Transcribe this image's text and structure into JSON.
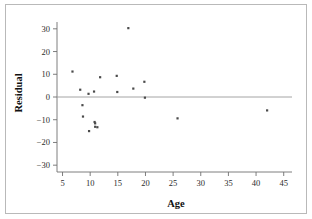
{
  "chart_data": {
    "type": "scatter",
    "title": "",
    "xlabel": "Age",
    "ylabel": "Residual",
    "xlim": [
      4,
      46.5
    ],
    "ylim": [
      -33,
      33
    ],
    "xticks": [
      5,
      10,
      15,
      20,
      25,
      30,
      35,
      40,
      45
    ],
    "yticks": [
      30,
      20,
      10,
      0,
      -10,
      -20,
      -30
    ],
    "xtick_labels": [
      "5",
      "10",
      "15",
      "20",
      "25",
      "30",
      "35",
      "40",
      "45"
    ],
    "ytick_labels": [
      "30",
      "20",
      "10",
      "0",
      "−10",
      "−20",
      "−30"
    ],
    "grid": false,
    "legend": false,
    "reference_line": {
      "orientation": "horizontal",
      "y": 0
    },
    "marker": {
      "shape": "square",
      "size": 2.2,
      "color": "#4a4a4a"
    },
    "points": [
      {
        "x": 6.8,
        "y": 11.2
      },
      {
        "x": 8.2,
        "y": 3.2
      },
      {
        "x": 8.6,
        "y": -3.6
      },
      {
        "x": 8.7,
        "y": -8.6
      },
      {
        "x": 9.7,
        "y": 1.4
      },
      {
        "x": 9.8,
        "y": -15.0
      },
      {
        "x": 10.7,
        "y": 2.4
      },
      {
        "x": 10.8,
        "y": -11.0
      },
      {
        "x": 10.9,
        "y": -11.6
      },
      {
        "x": 10.9,
        "y": -13.1
      },
      {
        "x": 11.3,
        "y": -13.3
      },
      {
        "x": 11.8,
        "y": 8.7
      },
      {
        "x": 14.8,
        "y": 9.3
      },
      {
        "x": 14.9,
        "y": 2.2
      },
      {
        "x": 16.9,
        "y": 30.3
      },
      {
        "x": 17.8,
        "y": 3.7
      },
      {
        "x": 19.8,
        "y": 6.7
      },
      {
        "x": 19.9,
        "y": -0.3
      },
      {
        "x": 25.8,
        "y": -9.4
      },
      {
        "x": 42.0,
        "y": -5.9
      }
    ]
  },
  "axes": {
    "x_title": "Age",
    "y_title": "Residual"
  }
}
